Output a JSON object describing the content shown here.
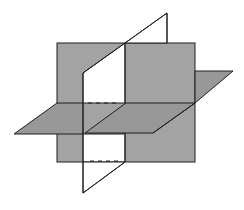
{
  "diagram": {
    "colors": {
      "background": "#ffffff",
      "plane_fill": "#a3a3a3",
      "horizontal_fill": "#989898",
      "vertical_fill": "#ffffff",
      "stroke": "#1e1e1e"
    },
    "planes": [
      {
        "name": "frontal-plane",
        "fill": "gray"
      },
      {
        "name": "horizontal-plane",
        "fill": "gray"
      },
      {
        "name": "vertical-plane",
        "fill": "white"
      }
    ],
    "hidden_edges": [
      {
        "name": "upper-hidden-intersection",
        "style": "dashed"
      },
      {
        "name": "lower-hidden-intersection",
        "style": "dashed"
      }
    ]
  }
}
